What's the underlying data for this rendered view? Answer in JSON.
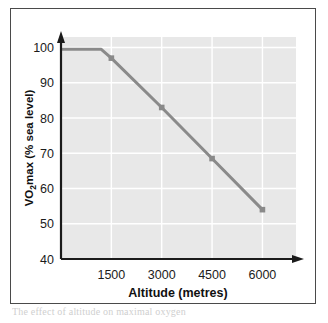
{
  "figure": {
    "background_color": "#ffffff",
    "frame_color": "#4a4a4a",
    "plot_background_color": "#e8e8e8",
    "gridline_color": "#ffffff",
    "axis_color": "#1b1b1b",
    "series_color": "#8a8a8a"
  },
  "caption": {
    "text": "The effect of altitude on maximal oxygen"
  },
  "chart_data": {
    "type": "line",
    "title": "",
    "xlabel": "Altitude (metres)",
    "ylabel": "VO2max (% sea level)",
    "ylabel_parts": {
      "pre": "VO",
      "sub": "2",
      "post": "max (% sea level)"
    },
    "xlim": [
      0,
      7000
    ],
    "ylim": [
      40,
      103
    ],
    "xticks": [
      1500,
      3000,
      4500,
      6000
    ],
    "xtick_labels": [
      "1500",
      "3000",
      "4500",
      "6000"
    ],
    "yticks": [
      40,
      50,
      60,
      70,
      80,
      90,
      100
    ],
    "ytick_labels": [
      "40",
      "50",
      "60",
      "70",
      "80",
      "90",
      "100"
    ],
    "grid": true,
    "grid_axis": "both",
    "legend": false,
    "legend_position": "none",
    "axis_arrows": true,
    "series": [
      {
        "name": "VO2max vs altitude",
        "color": "#8a8a8a",
        "line_width": 3,
        "marker": "square",
        "x": [
          0,
          1200,
          1500,
          3000,
          4500,
          6000
        ],
        "y": [
          99.5,
          99.5,
          97.0,
          83.0,
          68.5,
          54.0
        ],
        "marker_x": [
          1500,
          3000,
          4500,
          6000
        ],
        "marker_y": [
          97.0,
          83.0,
          68.5,
          54.0
        ]
      }
    ]
  }
}
